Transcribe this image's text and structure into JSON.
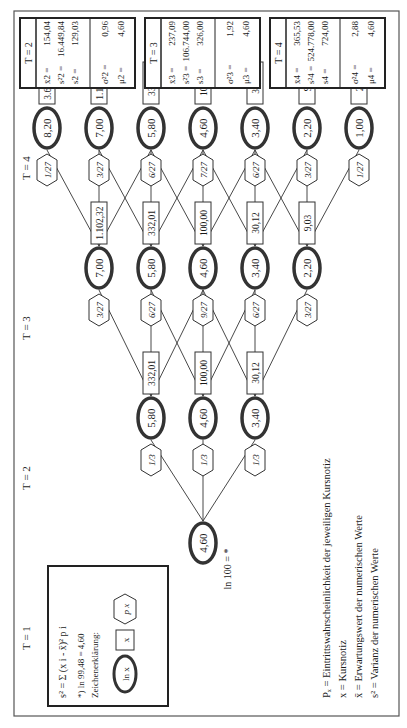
{
  "periods": [
    "T = 1",
    "T = 2",
    "T = 3",
    "T = 4"
  ],
  "root": {
    "label": "ln 100 = *",
    "ln": "4,60"
  },
  "t2": {
    "nodes": [
      {
        "ln": "5,80",
        "x": "332,01",
        "p": "1/3"
      },
      {
        "ln": "4,60",
        "x": "100,00",
        "p": "1/3"
      },
      {
        "ln": "3,40",
        "x": "30,12",
        "p": "1/3"
      }
    ]
  },
  "t3": {
    "nodes": [
      {
        "ln": "7,00",
        "x": "1.102,32",
        "p": "3/27"
      },
      {
        "ln": "5,80",
        "x": "332,01",
        "p": "6/27"
      },
      {
        "ln": "4,60",
        "x": "100,00",
        "p": "9/27"
      },
      {
        "ln": "3,40",
        "x": "30,12",
        "p": "6/27"
      },
      {
        "ln": "2,20",
        "x": "9,03",
        "p": "3/27"
      }
    ]
  },
  "t4": {
    "nodes": [
      {
        "ln": "8,20",
        "x": "3.659,82",
        "p": "1/27"
      },
      {
        "ln": "7,00",
        "x": "1.102,32",
        "p": "3/27"
      },
      {
        "ln": "5,80",
        "x": "332,01",
        "p": "6/27"
      },
      {
        "ln": "4,60",
        "x": "100,00",
        "p": "7/27"
      },
      {
        "ln": "3,40",
        "x": "30,12",
        "p": "6/27"
      },
      {
        "ln": "2,20",
        "x": "9,03",
        "p": "3/27"
      },
      {
        "ln": "1,00",
        "x": "2,73",
        "p": "1/27"
      }
    ]
  },
  "stats": [
    {
      "title": "T = 2",
      "xbar": "154,04",
      "s2": "16.449,84",
      "s": "129,03",
      "sigma2": "0,96",
      "mu": "4,60",
      "sub": "2"
    },
    {
      "title": "T = 3",
      "xbar": "237,09",
      "s2": "106.744,00",
      "s": "326,00",
      "sigma2": "1,92",
      "mu": "4,60",
      "sub": "3"
    },
    {
      "title": "T = 4",
      "xbar": "365,53",
      "s2": "524.778,00",
      "s": "724,00",
      "sigma2": "2,88",
      "mu": "4,60",
      "sub": "4"
    }
  ],
  "legend_box": {
    "formula": "s² = Σ (x i - x̄)² p i",
    "note": "*) ln 99,48 = 4,60",
    "heading": "Zeichenerklärung:",
    "sym_ln": "ln x",
    "sym_x": "x",
    "sym_p": "p x"
  },
  "legend": [
    "Pₓ = Eintrittswahrscheinlichkeit der jeweiligen Kursnotiz",
    "x  = Kursnotiz",
    "x̄  = Erwartungswert der numerischen Werte",
    "s² = Varianz der numerischen Werte"
  ]
}
